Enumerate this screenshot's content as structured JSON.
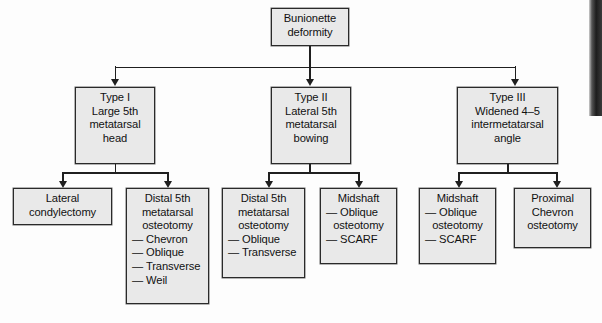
{
  "diagram": {
    "type": "flowchart",
    "root": {
      "id": "root",
      "lines": [
        "Bunionette",
        "deformity"
      ]
    },
    "types": [
      {
        "id": "type-1",
        "lines": [
          "Type I",
          "Large 5th",
          "metatarsal",
          "head"
        ]
      },
      {
        "id": "type-2",
        "lines": [
          "Type II",
          "Lateral 5th",
          "metatarsal",
          "bowing"
        ]
      },
      {
        "id": "type-3",
        "lines": [
          "Type III",
          "Widened 4–5",
          "intermetatarsal",
          "angle"
        ]
      }
    ],
    "treatments": [
      {
        "id": "lateral-condylectomy",
        "parent": "type-1",
        "heading": [
          "Lateral",
          "condylectomy"
        ],
        "items": []
      },
      {
        "id": "distal-5th-metatarsal-osteotomy-1",
        "parent": "type-1",
        "heading": [
          "Distal 5th",
          "metatarsal",
          "osteotomy"
        ],
        "items": [
          "— Chevron",
          "— Oblique",
          "— Transverse",
          "— Weil"
        ]
      },
      {
        "id": "distal-5th-metatarsal-osteotomy-2",
        "parent": "type-2",
        "heading": [
          "Distal 5th",
          "metatarsal",
          "osteotomy"
        ],
        "items": [
          "— Oblique",
          "— Transverse"
        ]
      },
      {
        "id": "midshaft-osteotomy-1",
        "parent": "type-2",
        "heading": [
          "Midshaft",
          "— Oblique",
          "osteotomy"
        ],
        "items": [
          "— SCARF"
        ]
      },
      {
        "id": "midshaft-osteotomy-2",
        "parent": "type-3",
        "heading": [
          "Midshaft",
          "— Oblique",
          "osteotomy"
        ],
        "items": [
          "— SCARF"
        ]
      },
      {
        "id": "proximal-chevron-osteotomy",
        "parent": "type-3",
        "heading": [
          "Proximal",
          "Chevron",
          "osteotomy"
        ],
        "items": []
      }
    ]
  },
  "nodes": {
    "root": {
      "l1": "Bunionette",
      "l2": "deformity"
    },
    "type1": {
      "l1": "Type I",
      "l2": "Large 5th",
      "l3": "metatarsal",
      "l4": "head"
    },
    "type2": {
      "l1": "Type II",
      "l2": "Lateral 5th",
      "l3": "metatarsal",
      "l4": "bowing"
    },
    "type3": {
      "l1": "Type III",
      "l2": "Widened 4–5",
      "l3": "intermetatarsal",
      "l4": "angle"
    },
    "lateralCondylectomy": {
      "l1": "Lateral",
      "l2": "condylectomy"
    },
    "distalOsteotomyA": {
      "l1": "Distal 5th",
      "l2": "metatarsal",
      "l3": "osteotomy",
      "i1": "— Chevron",
      "i2": "— Oblique",
      "i3": "— Transverse",
      "i4": "— Weil"
    },
    "distalOsteotomyB": {
      "l1": "Distal 5th",
      "l2": "metatarsal",
      "l3": "osteotomy",
      "i1": "— Oblique",
      "i2": "— Transverse"
    },
    "midshaftA": {
      "l1": "Midshaft",
      "l2": "— Oblique",
      "l3": "osteotomy",
      "i1": "— SCARF"
    },
    "midshaftB": {
      "l1": "Midshaft",
      "l2": "— Oblique",
      "l3": "osteotomy",
      "i1": "— SCARF"
    },
    "proximalChevron": {
      "l1": "Proximal",
      "l2": "Chevron",
      "l3": "osteotomy"
    }
  },
  "colors": {
    "box_fill": "#e9e9e9",
    "box_border": "#2a2a2a",
    "text": "#111111",
    "connector": "#1f1f1f",
    "page_background": "#fdfdfd"
  }
}
